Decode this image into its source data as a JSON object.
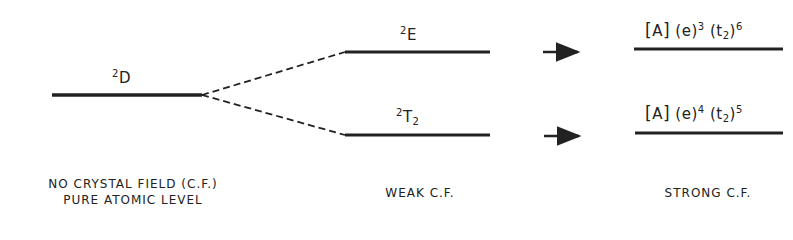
{
  "levels": {
    "free_ion": {
      "label": "D",
      "multiplicity": "2"
    },
    "weak_upper": {
      "label": "E",
      "multiplicity": "2"
    },
    "weak_lower": {
      "label": "T",
      "multiplicity": "2",
      "subscript": "2"
    },
    "strong_upper": {
      "core": "A",
      "e_orbital": "e",
      "e_count": "3",
      "t_orbital": "t",
      "t_sub": "2",
      "t_count": "6"
    },
    "strong_lower": {
      "core": "A",
      "e_orbital": "e",
      "e_count": "4",
      "t_orbital": "t",
      "t_sub": "2",
      "t_count": "5"
    }
  },
  "captions": {
    "no_field_line1": "NO CRYSTAL FIELD (C.F.)",
    "no_field_line2": "PURE ATOMIC LEVEL",
    "weak": "WEAK C.F.",
    "strong": "STRONG C.F."
  },
  "colors": {
    "line": "#222222",
    "background": "#ffffff"
  }
}
